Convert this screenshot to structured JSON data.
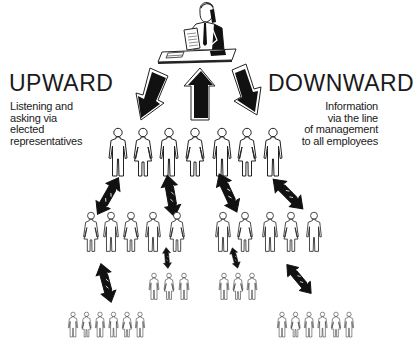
{
  "diagram": {
    "title_left": "UPWARD",
    "caption_left": [
      "Listening and",
      "asking via",
      "elected",
      "representatives"
    ],
    "title_right": "DOWNWARD",
    "caption_right": [
      "Information",
      "via the line",
      "of management",
      "to all employees"
    ],
    "top_figure": "manager-at-desk-on-phone",
    "main_arrows": [
      {
        "direction": "down-left",
        "meaning": "downward-left"
      },
      {
        "direction": "up",
        "meaning": "upward"
      },
      {
        "direction": "down-right",
        "meaning": "downward-right"
      }
    ],
    "levels": [
      {
        "name": "row-1",
        "count": 7
      },
      {
        "name": "row-2",
        "count": 10
      },
      {
        "name": "row-3",
        "count": 6
      },
      {
        "name": "row-4",
        "count": 12
      }
    ],
    "colors": {
      "ink": "#111111",
      "background": "#ffffff",
      "arrow_fill": "#111111"
    }
  }
}
